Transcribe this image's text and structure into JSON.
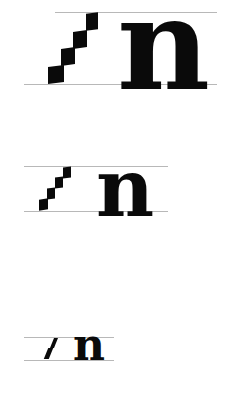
{
  "diagram": {
    "rows": [
      {
        "label": "large",
        "letter": "n",
        "nib_widths": 4
      },
      {
        "label": "medium",
        "letter": "n",
        "nib_widths": 4
      },
      {
        "label": "small",
        "letter": "n",
        "nib_widths": 2
      }
    ],
    "colors": {
      "ink": "#0a0a0a",
      "guideline": "#b8b8b8",
      "background": "#ffffff"
    }
  }
}
